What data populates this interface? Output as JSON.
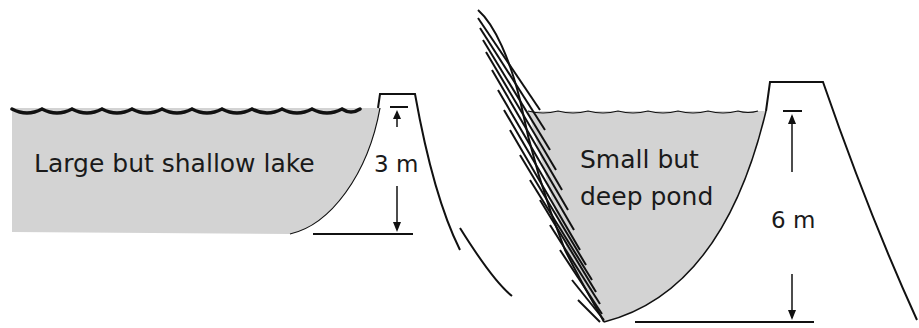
{
  "diagram": {
    "left_panel": {
      "label": "Large but shallow lake",
      "depth_label": "3 m",
      "depth_m": 3
    },
    "right_panel": {
      "label_line1": "Small but",
      "label_line2": "deep pond",
      "depth_label": "6 m",
      "depth_m": 6
    },
    "colors": {
      "water_fill": "#d3d3d3",
      "line": "#111111"
    }
  }
}
